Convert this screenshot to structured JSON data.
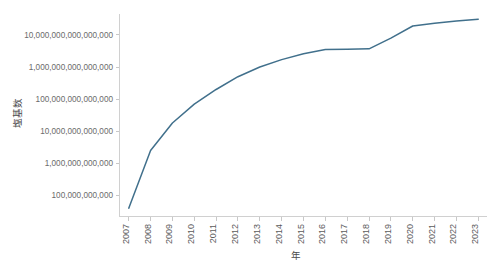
{
  "chart_data": {
    "type": "line",
    "title": "",
    "subtitle": "",
    "xlabel": "年",
    "ylabel": "塩基数",
    "xscale": "linear",
    "yscale": "log",
    "grid": false,
    "legend": false,
    "legend_position": "none",
    "line_color": "#41708c",
    "x": [
      2007,
      2008,
      2009,
      2010,
      2011,
      2012,
      2013,
      2014,
      2015,
      2016,
      2017,
      2018,
      2019,
      2020,
      2021,
      2022,
      2023
    ],
    "xtick_labels": [
      "2007",
      "2008",
      "2009",
      "2010",
      "2011",
      "2012",
      "2013",
      "2014",
      "2015",
      "2016",
      "2017",
      "2018",
      "2019",
      "2020",
      "2021",
      "2022",
      "2023"
    ],
    "ytick_labels": [
      "100,000,000,000",
      "1,000,000,000,000",
      "10,000,000,000,000",
      "100,000,000,000,000",
      "1,000,000,000,000,000",
      "10,000,000,000,000,000"
    ],
    "ytick_values": [
      100000000000.0,
      1000000000000.0,
      10000000000000.0,
      100000000000000.0,
      1000000000000000.0,
      1e+16
    ],
    "ylim": [
      22000000000.0,
      4.5e+16
    ],
    "xlim": [
      2006.6,
      2023.4
    ],
    "series": [
      {
        "name": "塩基数",
        "values": [
          40000000000.0,
          2500000000000.0,
          18000000000000.0,
          70000000000000.0,
          200000000000000.0,
          500000000000000.0,
          1000000000000000.0,
          1700000000000000.0,
          2600000000000000.0,
          3500000000000000.0,
          3600000000000000.0,
          3700000000000000.0,
          8000000000000000.0,
          1.9e+16,
          2.3e+16,
          2.7e+16,
          3.1e+16
        ]
      }
    ]
  }
}
